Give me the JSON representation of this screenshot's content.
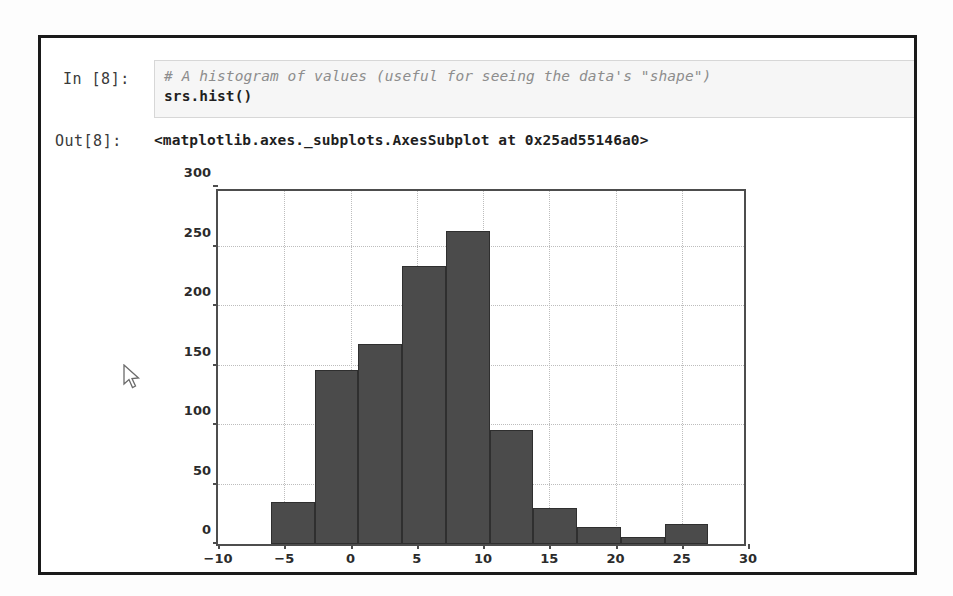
{
  "notebook": {
    "in_prompt": "In [8]:",
    "out_prompt": "Out[8]:",
    "code_comment": "# A histogram of values (useful for seeing the data's \"shape\")",
    "code_line": "srs.hist()",
    "output_text": "<matplotlib.axes._subplots.AxesSubplot at 0x25ad55146a0>"
  },
  "colors": {
    "bar_fill": "#4b4b4b",
    "bar_edge": "#2f2f2f",
    "axis": "#4d4d4d",
    "grid": "#bdbdbd",
    "cell_bg": "#f6f6f6",
    "frame": "#1a1a1a",
    "comment_text": "#8d8d8d"
  },
  "chart_data": {
    "type": "bar",
    "title": "",
    "xlabel": "",
    "ylabel": "",
    "xlim": [
      -10,
      30
    ],
    "ylim": [
      0,
      300
    ],
    "xticks": [
      -10,
      -5,
      0,
      5,
      10,
      15,
      20,
      25,
      30
    ],
    "yticks": [
      0,
      50,
      100,
      150,
      200,
      250,
      300
    ],
    "grid": true,
    "legend": "none",
    "bin_edges": [
      -6.0,
      -2.7,
      0.6,
      3.9,
      7.2,
      10.5,
      13.8,
      17.1,
      20.4,
      23.7,
      27.0,
      30.0
    ],
    "values": [
      35,
      146,
      168,
      234,
      263,
      96,
      30,
      14,
      6,
      17
    ],
    "bins": [
      {
        "x0": -6.0,
        "x1": -2.7,
        "count": 35
      },
      {
        "x0": -2.7,
        "x1": 0.6,
        "count": 146
      },
      {
        "x0": 0.6,
        "x1": 3.9,
        "count": 168
      },
      {
        "x0": 3.9,
        "x1": 7.2,
        "count": 234
      },
      {
        "x0": 7.2,
        "x1": 10.5,
        "count": 263
      },
      {
        "x0": 10.5,
        "x1": 13.8,
        "count": 96
      },
      {
        "x0": 13.8,
        "x1": 17.1,
        "count": 30
      },
      {
        "x0": 17.1,
        "x1": 20.4,
        "count": 14
      },
      {
        "x0": 20.4,
        "x1": 23.7,
        "count": 6
      },
      {
        "x0": 23.7,
        "x1": 27.0,
        "count": 17
      }
    ]
  }
}
